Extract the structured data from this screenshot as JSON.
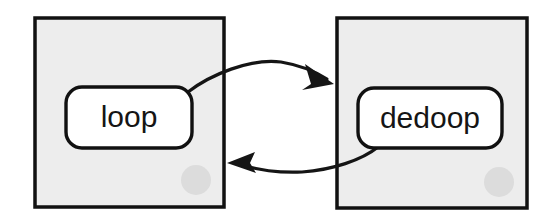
{
  "diagram": {
    "type": "two-node-cycle",
    "background_color": "#ffffff",
    "container_fill": "#ededed",
    "container_stroke": "#111111",
    "node_fill": "#ffffff",
    "node_stroke": "#111111",
    "arrow_color": "#151515",
    "badge_color": "#dcdcdc",
    "containers": [
      {
        "id": "left-container",
        "name": "loop-container",
        "x": 35,
        "y": 18,
        "width": 189,
        "height": 189
      },
      {
        "id": "right-container",
        "name": "dedoop-container",
        "x": 337,
        "y": 18,
        "width": 190,
        "height": 190
      }
    ],
    "nodes": [
      {
        "id": "loop",
        "label": "loop",
        "x": 66,
        "y": 87,
        "width": 126,
        "height": 61,
        "radius": 16
      },
      {
        "id": "dedoop",
        "label": "dedoop",
        "x": 358,
        "y": 88,
        "width": 144,
        "height": 60,
        "radius": 16
      }
    ],
    "badges": [
      {
        "id": "left-badge",
        "cx": 196,
        "cy": 180,
        "r": 15
      },
      {
        "id": "right-badge",
        "cx": 499,
        "cy": 182,
        "r": 15
      }
    ],
    "edges": [
      {
        "id": "loop-to-dedoop",
        "from": "loop",
        "to": "dedoop",
        "label": "",
        "direction": "right",
        "path": "M 188 92 C 210 75 250 58 280 62 C 300 65 318 72 330 79"
      },
      {
        "id": "dedoop-to-loop",
        "from": "dedoop",
        "to": "loop",
        "label": "",
        "direction": "left",
        "path": "M 378 147 C 360 160 330 170 300 172 C 275 173 252 170 234 165"
      }
    ]
  }
}
